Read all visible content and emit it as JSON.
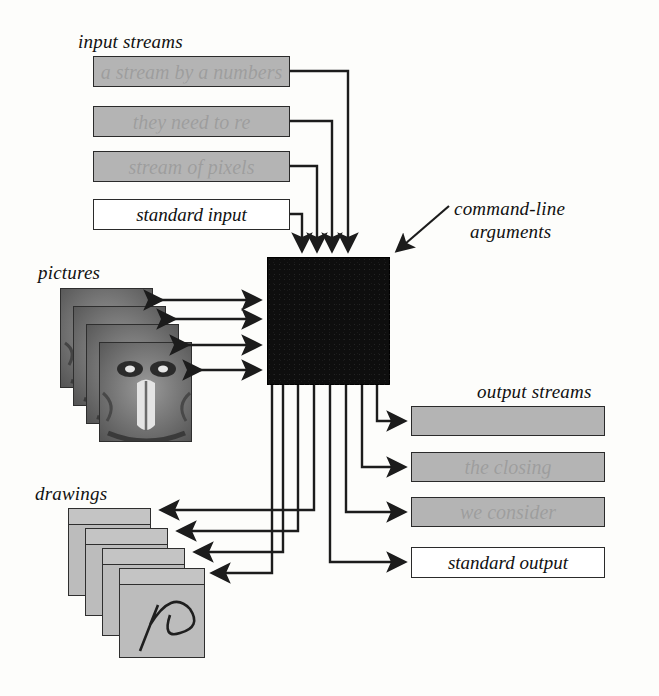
{
  "diagram": {
    "labels": {
      "input_streams": "input streams",
      "standard_input": "standard input",
      "command_line_arguments_line1": "command-line",
      "command_line_arguments_line2": "arguments",
      "pictures": "pictures",
      "drawings": "drawings",
      "output_streams": "output streams",
      "standard_output": "standard output"
    },
    "colors": {
      "stream_fill": "#b4b4b4",
      "stream_stroke": "#2a2a2a",
      "processor_fill": "#0e0e0e",
      "picture_fill": "#8d8d8d",
      "drawing_fill": "#bcbcbc",
      "wire_stroke": "#1c1c1c",
      "page_background": "#fdfdfb"
    },
    "input_streams": [
      {
        "ghost_text": "a stream by a numbers",
        "filled": true
      },
      {
        "ghost_text": "they need to re",
        "filled": true
      },
      {
        "ghost_text": "stream of pixels",
        "filled": true
      },
      {
        "caption": "standard input",
        "filled": false
      }
    ],
    "output_streams": [
      {
        "ghost_text": "",
        "filled": true
      },
      {
        "ghost_text": "the closing",
        "filled": true
      },
      {
        "ghost_text": "we consider",
        "filled": true
      },
      {
        "caption": "standard output",
        "filled": false
      }
    ],
    "picture_stack": {
      "count": 4,
      "subject": "mandrill-face"
    },
    "drawing_stack": {
      "count": 4,
      "subject": "curved-scribble"
    },
    "counts": {
      "input_arrows": 4,
      "output_arrows": 4,
      "picture_arrows": 4,
      "drawing_arrows": 4,
      "processor_drop_lines": 8
    }
  }
}
